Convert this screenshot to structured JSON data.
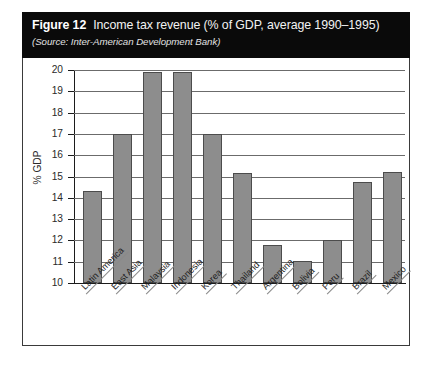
{
  "figure": {
    "number_label": "Figure 12",
    "title": "Income tax revenue (% of GDP, average 1990–1995)",
    "source": "(Source: Inter-American Development Bank)"
  },
  "chart_data": {
    "type": "bar",
    "title": "Income tax revenue (% of GDP, average 1990–1995)",
    "subtitle": "(Source: Inter-American Development Bank)",
    "xlabel": "",
    "ylabel": "% GDP",
    "ylim": [
      10,
      20
    ],
    "ytick_labels": [
      "20",
      "19",
      "18",
      "17",
      "16",
      "15",
      "14",
      "13",
      "12",
      "11",
      "10"
    ],
    "yticks": [
      20,
      19,
      18,
      17,
      16,
      15,
      14,
      13,
      12,
      11,
      10
    ],
    "grid": true,
    "legend": null,
    "bar_color": "#8d8d8d",
    "bar_edge_color": "#4c4c4c",
    "categories": [
      "Latin America",
      "East Asia",
      "Malaysia",
      "Indonesia",
      "Korea",
      "Thailand",
      "Argentina",
      "Bolivia",
      "Peru",
      "Brazil",
      "Mexico"
    ],
    "values": [
      14.3,
      17.0,
      19.9,
      19.9,
      17.0,
      15.15,
      11.8,
      11.05,
      12.0,
      14.75,
      15.2
    ]
  }
}
